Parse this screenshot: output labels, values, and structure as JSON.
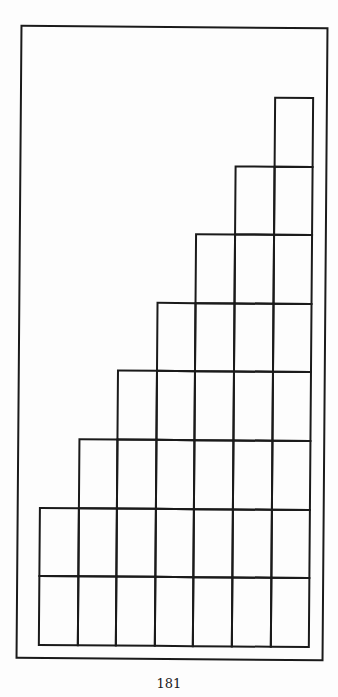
{
  "diagram": {
    "type": "staircase-grid",
    "columns": 7,
    "rows": 8,
    "row_cell_counts_top_to_bottom": [
      1,
      2,
      3,
      4,
      5,
      6,
      7,
      7
    ],
    "alignment": "right",
    "line_color": "#1a1a1a",
    "background_color": "#ffffff"
  },
  "layout": {
    "grid_left": 41,
    "grid_top": 97,
    "cell_width": 38.6,
    "cell_height": 68.6
  },
  "footer": {
    "page_number": "181"
  }
}
